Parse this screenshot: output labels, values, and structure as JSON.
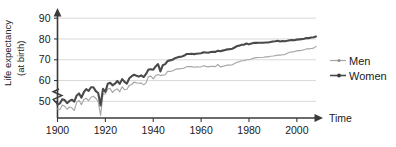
{
  "chart_data": {
    "type": "line",
    "title": "",
    "xlabel": "Time",
    "ylabel": "Life expectancy (at birth)",
    "ylabel_line1": "Life expectancy",
    "ylabel_line2": "(at birth)",
    "xlim": [
      1900,
      2008
    ],
    "ylim": [
      42,
      92
    ],
    "yticks": [
      50,
      60,
      70,
      80,
      90
    ],
    "ytick_labels": [
      "50",
      "60",
      "70",
      "80",
      "90"
    ],
    "xticks": [
      1900,
      1920,
      1940,
      1960,
      1980,
      2000
    ],
    "xtick_labels": [
      "1900",
      "1920",
      "1940",
      "1960",
      "1980",
      "2000"
    ],
    "grid": "horizontal",
    "legend_position": "right",
    "axis_break": "y-axis zigzag below 50",
    "colors": {
      "women": "#4a4a4a",
      "men": "#a6a6a6",
      "grid": "#c9c9c9",
      "axis": "#3a3a3a",
      "background": "#ffffff"
    },
    "series": [
      {
        "name": "Men",
        "color": "#a6a6a6",
        "x": [
          1900,
          1901,
          1902,
          1903,
          1904,
          1905,
          1906,
          1907,
          1908,
          1909,
          1910,
          1911,
          1912,
          1913,
          1914,
          1915,
          1916,
          1917,
          1918,
          1919,
          1920,
          1921,
          1922,
          1923,
          1924,
          1925,
          1926,
          1927,
          1928,
          1929,
          1930,
          1931,
          1932,
          1933,
          1934,
          1935,
          1936,
          1937,
          1938,
          1939,
          1940,
          1941,
          1942,
          1943,
          1944,
          1945,
          1946,
          1947,
          1948,
          1949,
          1950,
          1951,
          1952,
          1953,
          1954,
          1955,
          1956,
          1957,
          1958,
          1959,
          1960,
          1961,
          1962,
          1963,
          1964,
          1965,
          1966,
          1967,
          1968,
          1969,
          1970,
          1971,
          1972,
          1973,
          1974,
          1975,
          1976,
          1977,
          1978,
          1979,
          1980,
          1981,
          1982,
          1983,
          1984,
          1985,
          1986,
          1987,
          1988,
          1989,
          1990,
          1991,
          1992,
          1993,
          1994,
          1995,
          1996,
          1997,
          1998,
          1999,
          2000,
          2001,
          2002,
          2003,
          2004,
          2005,
          2006,
          2007,
          2008
        ],
        "values": [
          46.3,
          46.0,
          48.2,
          47.6,
          46.2,
          47.3,
          46.9,
          45.6,
          49.5,
          50.5,
          48.4,
          50.9,
          51.5,
          50.3,
          52.0,
          52.5,
          51.5,
          50.0,
          43.2,
          53.5,
          53.6,
          56.0,
          56.2,
          54.2,
          55.5,
          56.0,
          54.6,
          57.0,
          55.6,
          55.8,
          57.7,
          58.1,
          59.3,
          58.9,
          58.7,
          58.9,
          57.9,
          58.9,
          61.9,
          62.1,
          60.8,
          62.4,
          62.9,
          62.4,
          62.6,
          62.8,
          64.4,
          64.4,
          64.6,
          65.2,
          65.6,
          65.6,
          65.8,
          66.0,
          66.7,
          66.7,
          66.7,
          66.4,
          66.6,
          66.5,
          66.6,
          67.1,
          66.8,
          66.6,
          66.9,
          66.8,
          66.7,
          67.8,
          66.6,
          66.8,
          67.1,
          67.4,
          67.4,
          67.6,
          68.2,
          68.8,
          69.1,
          69.5,
          69.6,
          70.0,
          70.0,
          70.4,
          70.8,
          71.0,
          71.1,
          71.1,
          71.2,
          71.4,
          71.4,
          71.7,
          71.8,
          72.0,
          72.3,
          72.2,
          72.4,
          72.5,
          73.1,
          73.6,
          73.8,
          73.9,
          74.3,
          74.4,
          74.5,
          74.8,
          75.2,
          75.2,
          75.4,
          75.6,
          76.4
        ],
        "endpoint_value": 76.4
      },
      {
        "name": "Women",
        "color": "#4a4a4a",
        "x": [
          1900,
          1901,
          1902,
          1903,
          1904,
          1905,
          1906,
          1907,
          1908,
          1909,
          1910,
          1911,
          1912,
          1913,
          1914,
          1915,
          1916,
          1917,
          1918,
          1919,
          1920,
          1921,
          1922,
          1923,
          1924,
          1925,
          1926,
          1927,
          1928,
          1929,
          1930,
          1931,
          1932,
          1933,
          1934,
          1935,
          1936,
          1937,
          1938,
          1939,
          1940,
          1941,
          1942,
          1943,
          1944,
          1945,
          1946,
          1947,
          1948,
          1949,
          1950,
          1951,
          1952,
          1953,
          1954,
          1955,
          1956,
          1957,
          1958,
          1959,
          1960,
          1961,
          1962,
          1963,
          1964,
          1965,
          1966,
          1967,
          1968,
          1969,
          1970,
          1971,
          1972,
          1973,
          1974,
          1975,
          1976,
          1977,
          1978,
          1979,
          1980,
          1981,
          1982,
          1983,
          1984,
          1985,
          1986,
          1987,
          1988,
          1989,
          1990,
          1991,
          1992,
          1993,
          1994,
          1995,
          1996,
          1997,
          1998,
          1999,
          2000,
          2001,
          2002,
          2003,
          2004,
          2005,
          2006,
          2007,
          2008
        ],
        "values": [
          48.3,
          49.0,
          51.0,
          50.6,
          49.1,
          50.2,
          50.8,
          49.9,
          52.8,
          53.8,
          51.8,
          54.4,
          55.9,
          55.0,
          56.8,
          56.8,
          54.9,
          54.0,
          48.0,
          56.0,
          54.6,
          58.5,
          58.9,
          57.7,
          58.5,
          59.8,
          58.4,
          60.7,
          59.4,
          58.5,
          61.1,
          62.1,
          62.8,
          62.3,
          61.9,
          62.5,
          61.7,
          63.2,
          65.3,
          65.4,
          65.2,
          66.8,
          67.9,
          64.4,
          67.4,
          67.9,
          69.4,
          69.7,
          70.0,
          70.7,
          71.1,
          71.4,
          71.6,
          72.0,
          72.8,
          72.8,
          72.9,
          72.7,
          72.9,
          73.0,
          73.1,
          73.6,
          73.5,
          73.4,
          73.7,
          73.8,
          73.8,
          74.3,
          74.1,
          74.4,
          74.7,
          75.0,
          75.1,
          75.3,
          75.9,
          76.6,
          76.8,
          77.2,
          77.3,
          77.8,
          77.4,
          77.8,
          78.1,
          78.1,
          78.2,
          78.2,
          78.2,
          78.3,
          78.3,
          78.5,
          78.8,
          78.9,
          79.1,
          78.8,
          79.0,
          78.9,
          79.1,
          79.4,
          79.5,
          79.4,
          79.7,
          79.8,
          79.9,
          80.1,
          80.4,
          80.4,
          80.7,
          80.8,
          81.2
        ],
        "endpoint_value": 81.2
      }
    ],
    "annotations": [
      {
        "text": "1918 influenza pandemic dip",
        "x": 1918,
        "men_y": 43.2,
        "women_y": 48.0
      }
    ]
  },
  "legend": {
    "items": [
      {
        "label": "Men",
        "marker": "line-with-dot",
        "color": "#a6a6a6"
      },
      {
        "label": "Women",
        "marker": "line-with-dot",
        "color": "#4a4a4a"
      }
    ]
  }
}
